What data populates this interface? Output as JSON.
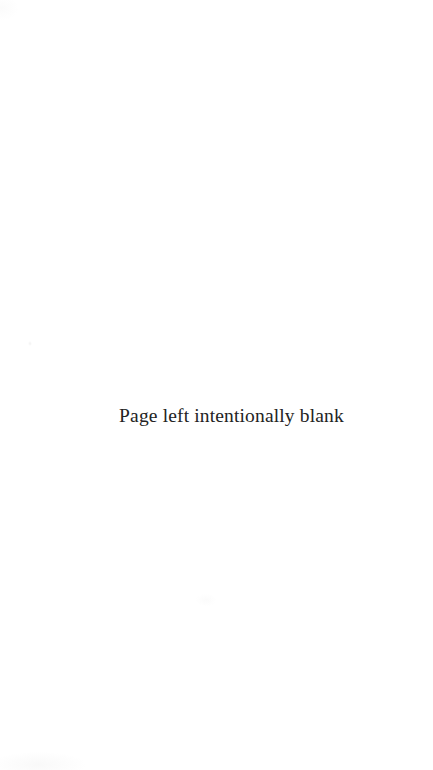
{
  "page": {
    "kind": "scanned-document-page",
    "background_color": "#ffffff",
    "width": 433,
    "height": 770
  },
  "content": {
    "notice": "Page left intentionally blank",
    "notice_color": "#232323"
  },
  "artifacts": {
    "left_margin_speck": "scan-speck",
    "bottom_left_smudge": "scan-smudge",
    "bottom_center_speck": "scan-speck",
    "top_left_smudge": "scan-smudge"
  }
}
